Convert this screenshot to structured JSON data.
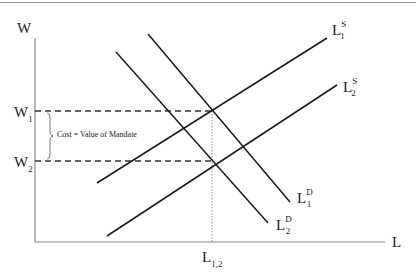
{
  "diagram": {
    "axes": {
      "y_label": "W",
      "x_label": "L",
      "origin": [
        35,
        242
      ],
      "y_top": 38,
      "x_right": 385
    },
    "levels": {
      "w1": {
        "base": "W",
        "sub": "1",
        "y": 111
      },
      "w2": {
        "base": "W",
        "sub": "2",
        "y": 161
      },
      "l12": {
        "base": "L",
        "sub": "1,2",
        "x": 212
      }
    },
    "annotation": {
      "text": "Cost = Value of Mandate"
    },
    "curves": [
      {
        "id": "supply-1",
        "base": "L",
        "sup": "S",
        "sub": "1",
        "x1": 97,
        "y1": 183,
        "x2": 327,
        "y2": 38
      },
      {
        "id": "supply-2",
        "base": "L",
        "sup": "S",
        "sub": "2",
        "x1": 107,
        "y1": 236,
        "x2": 337,
        "y2": 85
      },
      {
        "id": "demand-1",
        "base": "L",
        "sup": "D",
        "sub": "1",
        "x1": 148,
        "y1": 34,
        "x2": 290,
        "y2": 202
      },
      {
        "id": "demand-2",
        "base": "L",
        "sup": "D",
        "sub": "2",
        "x1": 116,
        "y1": 52,
        "x2": 268,
        "y2": 223
      }
    ],
    "colors": {
      "line": "#1a1a1a",
      "axis": "#8a8a8a",
      "text": "#222222"
    }
  }
}
